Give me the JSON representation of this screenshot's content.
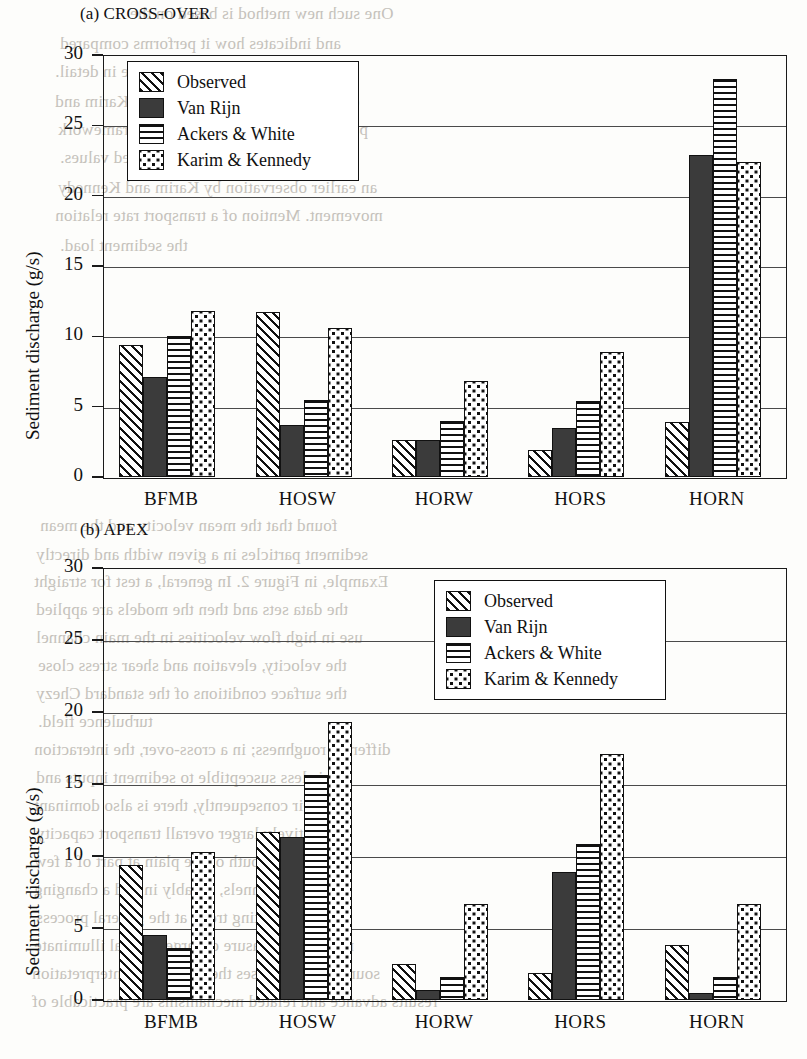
{
  "page": {
    "bleed_text": [
      {
        "t": "One such new method is based on the",
        "x": 130,
        "y": 4
      },
      {
        "t": "and indicates how it performs compared",
        "x": 60,
        "y": 34
      },
      {
        "t": "which are described here in detail.",
        "x": 55,
        "y": 62
      },
      {
        "t": "of the generalized version of the Karim and",
        "x": 55,
        "y": 92
      },
      {
        "t": "particle sizes. Within the general framework",
        "x": 58,
        "y": 120
      },
      {
        "t": "with the measured values.",
        "x": 60,
        "y": 148
      },
      {
        "t": "an earlier observation by Karim and Kennedy",
        "x": 58,
        "y": 178
      },
      {
        "t": "movement. Mention of a transport rate relation",
        "x": 55,
        "y": 206
      },
      {
        "t": "the sediment load.",
        "x": 60,
        "y": 236
      },
      {
        "t": "found that the mean velocity and the mean",
        "x": 40,
        "y": 516
      },
      {
        "t": "sediment particles in a given width and directly",
        "x": 36,
        "y": 545
      },
      {
        "t": "Example, in Figure 2. In general, a test for straight",
        "x": 34,
        "y": 572
      },
      {
        "t": "the data sets and then the models are applied",
        "x": 36,
        "y": 600
      },
      {
        "t": "use in high flow velocities in the main channel",
        "x": 36,
        "y": 628
      },
      {
        "t": "the velocity, elevation and shear stress close",
        "x": 38,
        "y": 656
      },
      {
        "t": "the surface conditions of the standard Chezy",
        "x": 36,
        "y": 684
      },
      {
        "t": "turbulence field.",
        "x": 38,
        "y": 712
      },
      {
        "t": "different roughness; in a cross-over, the interaction",
        "x": 34,
        "y": 740
      },
      {
        "t": "is less susceptible to sediment inputs and",
        "x": 36,
        "y": 768
      },
      {
        "t": "their consequently, there is also dominant",
        "x": 34,
        "y": 796
      },
      {
        "t": "a relatively larger overall transport capacity",
        "x": 36,
        "y": 824
      },
      {
        "t": "near the mouth of the plain at part of a few",
        "x": 34,
        "y": 852
      },
      {
        "t": "the main channels, notably in and a changing",
        "x": 34,
        "y": 880
      },
      {
        "t": "and a fluctuating trend at the general process",
        "x": 36,
        "y": 908
      },
      {
        "t": "rate and a measure of large general illuminate",
        "x": 34,
        "y": 936
      },
      {
        "t": "sources which raises the issue of its interpretation",
        "x": 32,
        "y": 964
      },
      {
        "t": "results advance and related mechanisms are practicable of",
        "x": 32,
        "y": 992
      }
    ]
  },
  "chart_data": [
    {
      "type": "bar",
      "id": "cross-over",
      "title": "(a) CROSS-OVER",
      "xlabel": "",
      "ylabel": "Sediment discharge (g/s)",
      "ylim": [
        0,
        30
      ],
      "yticks": [
        0,
        5,
        10,
        15,
        20,
        25,
        30
      ],
      "grid": true,
      "legend_position": "top-left-inside",
      "categories": [
        "BFMB",
        "HOSW",
        "HORW",
        "HORS",
        "HORN"
      ],
      "series": [
        {
          "name": "Observed",
          "pattern": "diagonal-hatch",
          "values": [
            9.4,
            11.7,
            2.6,
            1.9,
            3.9
          ]
        },
        {
          "name": "Van Rijn",
          "pattern": "solid-fill",
          "values": [
            7.1,
            3.7,
            2.6,
            3.5,
            22.9
          ]
        },
        {
          "name": "Ackers & White",
          "pattern": "horizontal-hatch",
          "values": [
            10.0,
            5.5,
            4.0,
            5.4,
            28.3
          ]
        },
        {
          "name": "Karim & Kennedy",
          "pattern": "dotted-fill",
          "values": [
            11.8,
            10.6,
            6.8,
            8.9,
            22.4
          ]
        }
      ]
    },
    {
      "type": "bar",
      "id": "apex",
      "title": "(b) APEX",
      "xlabel": "",
      "ylabel": "Sediment discharge (g/s)",
      "ylim": [
        0,
        30
      ],
      "yticks": [
        0,
        5,
        10,
        15,
        20,
        25,
        30
      ],
      "grid": true,
      "legend_position": "top-right-inside",
      "categories": [
        "BFMB",
        "HOSW",
        "HORW",
        "HORS",
        "HORN"
      ],
      "series": [
        {
          "name": "Observed",
          "pattern": "diagonal-hatch",
          "values": [
            9.4,
            11.7,
            2.5,
            1.9,
            3.8
          ]
        },
        {
          "name": "Van Rijn",
          "pattern": "solid-fill",
          "values": [
            4.5,
            11.3,
            0.7,
            8.9,
            0.5
          ]
        },
        {
          "name": "Ackers & White",
          "pattern": "horizontal-hatch",
          "values": [
            3.6,
            15.6,
            1.6,
            10.8,
            1.6
          ]
        },
        {
          "name": "Karim & Kennedy",
          "pattern": "dotted-fill",
          "values": [
            10.3,
            19.3,
            6.7,
            17.1,
            6.7
          ]
        }
      ]
    }
  ]
}
